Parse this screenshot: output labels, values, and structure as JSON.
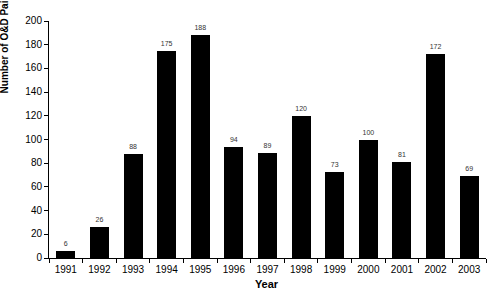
{
  "chart_data": {
    "type": "bar",
    "categories": [
      "1991",
      "1992",
      "1993",
      "1994",
      "1995",
      "1996",
      "1997",
      "1998",
      "1999",
      "2000",
      "2001",
      "2002",
      "2003"
    ],
    "values": [
      6,
      26,
      88,
      175,
      188,
      94,
      89,
      120,
      73,
      100,
      81,
      172,
      69
    ],
    "title": "",
    "xlabel": "Year",
    "ylabel": "Number of O&D Pairs",
    "ylim": [
      0,
      200
    ],
    "ytick_step": 20,
    "grid": false,
    "legend": null,
    "bar_color": "#000000",
    "value_label_color": "#333333",
    "axis_color": "#000000",
    "background_color": "#ffffff",
    "value_labels_shown": true
  }
}
